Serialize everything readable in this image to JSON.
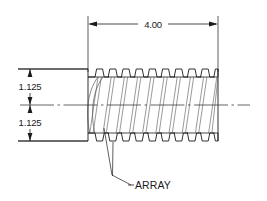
{
  "drawing": {
    "title": "Threaded Shaft Section View",
    "view_type": "orthographic-section",
    "units_note": "inches",
    "background_color": "#ffffff",
    "line_color": "#1b1b1b",
    "thin_line_color": "#555555",
    "centerline_color": "#3c3c3c",
    "dimensions": [
      {
        "name": "overall-length",
        "value": "4.00",
        "orientation": "horizontal",
        "position": "top",
        "x_start": 88,
        "x_end": 218,
        "y": 24
      },
      {
        "name": "upper-radius",
        "value": "1.125",
        "orientation": "vertical",
        "position": "left-upper",
        "y_start": 69,
        "y_end": 105,
        "x": 30
      },
      {
        "name": "lower-radius",
        "value": "1.125",
        "orientation": "vertical",
        "position": "left-lower",
        "y_start": 105,
        "y_end": 141,
        "x": 30
      }
    ],
    "annotations": [
      {
        "name": "array-callout",
        "text": "ARRAY",
        "text_x": 134,
        "text_y": 188,
        "leader_from_x": 112,
        "leader_from_y": 175,
        "leader_to_a_x": 104,
        "leader_to_a_y": 128,
        "leader_to_b_x": 113,
        "leader_to_b_y": 142
      }
    ],
    "geometry": {
      "body_left_x": 88,
      "body_right_x": 218,
      "top_y": 69,
      "bottom_y": 141,
      "centerline_y": 105,
      "centerline_left_x": 20,
      "centerline_right_x": 250,
      "thread_start_x": 95,
      "thread_count": 10,
      "thread_pitch": 13.2,
      "crest_flat": 6.0,
      "root_flat": 4.5,
      "flank_run": 1.6,
      "root_inset": 8.0,
      "shank_left_x": 18,
      "shank_right_x": 88
    }
  }
}
